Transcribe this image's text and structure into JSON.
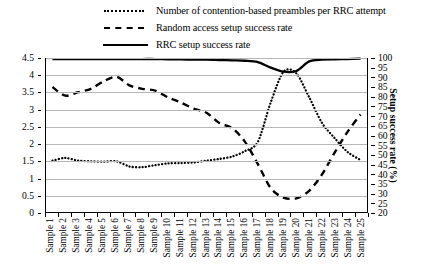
{
  "legend": {
    "items": [
      {
        "label": "Number of contention-based preambles per RRC attempt",
        "style": "dotted",
        "icon": "dotted-line-icon"
      },
      {
        "label": "Random access setup success rate",
        "style": "dashed",
        "icon": "dashed-line-icon"
      },
      {
        "label": "RRC setup success rate",
        "style": "solid",
        "icon": "solid-line-icon"
      }
    ]
  },
  "axes": {
    "left_ticks": [
      "4.5",
      "4",
      "3.5",
      "3",
      "2.5",
      "2",
      "1.5",
      "1",
      "0.5",
      "0"
    ],
    "right_ticks": [
      "100",
      "95",
      "90",
      "85",
      "80",
      "75",
      "70",
      "65",
      "60",
      "55",
      "50",
      "45",
      "40",
      "35",
      "30",
      "25",
      "20"
    ],
    "right_title": "Setup success rate (%)"
  },
  "chart_data": {
    "type": "line",
    "title": "",
    "xlabel": "",
    "ylabel": "",
    "ylabel_right": "Setup success rate (%)",
    "grid": true,
    "legend_position": "top",
    "categories": [
      "Sample 1",
      "Sample 2",
      "Sample 3",
      "Sample 4",
      "Sample 5",
      "Sample 6",
      "Sample 7",
      "Sample 8",
      "Sample 9",
      "Sample 10",
      "Sample 11",
      "Sample 12",
      "Sample 13",
      "Sample 14",
      "Sample 15",
      "Sample 16",
      "Sample 17",
      "Sample 18",
      "Sample 19",
      "Sample 20",
      "Sample 21",
      "Sample 22",
      "Sample 23",
      "Sample 24",
      "Sample 25"
    ],
    "ylim_left": [
      0,
      4.5
    ],
    "ylim_right": [
      20,
      100
    ],
    "left_axis_tick_step": 0.5,
    "right_axis_tick_step": 5,
    "series": [
      {
        "name": "Number of contention-based preambles per RRC attempt",
        "axis": "left",
        "style": "dotted",
        "values": [
          1.5,
          1.58,
          1.5,
          1.48,
          1.47,
          1.48,
          1.33,
          1.31,
          1.37,
          1.42,
          1.43,
          1.45,
          1.5,
          1.55,
          1.62,
          1.78,
          2.05,
          3.2,
          4.1,
          4.05,
          3.35,
          2.6,
          2.15,
          1.75,
          1.52
        ]
      },
      {
        "name": "Random access setup success rate",
        "axis": "right",
        "style": "dashed",
        "values_left_scale": [
          3.65,
          3.4,
          3.5,
          3.6,
          3.82,
          3.95,
          3.7,
          3.6,
          3.55,
          3.35,
          3.2,
          3.02,
          2.9,
          2.6,
          2.45,
          2.05,
          1.4,
          0.7,
          0.42,
          0.4,
          0.62,
          1.1,
          1.75,
          2.35,
          2.85
        ],
        "values": [
          85,
          80,
          82,
          84,
          88,
          90,
          86,
          84,
          83,
          79,
          77,
          74,
          72,
          66,
          64,
          56,
          45,
          33,
          28,
          27,
          31,
          40,
          51,
          62,
          71
        ]
      },
      {
        "name": "RRC setup success rate",
        "axis": "right",
        "style": "solid",
        "values_left_scale": [
          4.47,
          4.47,
          4.47,
          4.47,
          4.47,
          4.47,
          4.47,
          4.47,
          4.47,
          4.46,
          4.46,
          4.45,
          4.45,
          4.44,
          4.43,
          4.42,
          4.38,
          4.22,
          4.1,
          4.12,
          4.4,
          4.45,
          4.46,
          4.47,
          4.48
        ],
        "values": [
          99.5,
          99.5,
          99.5,
          99.5,
          99.5,
          99.5,
          99.5,
          99.5,
          99.5,
          99.3,
          99.3,
          99.1,
          99.1,
          98.9,
          98.7,
          98.6,
          97.8,
          94.9,
          91.0,
          91.5,
          98.2,
          99.1,
          99.3,
          99.5,
          99.7
        ]
      }
    ]
  }
}
